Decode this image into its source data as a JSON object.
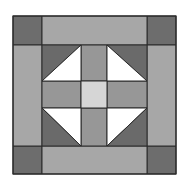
{
  "colors": {
    "background": "#ffffff",
    "line": "#2a2a2a",
    "corner_dark": "#6d6d6d",
    "border_strip": "#a7a7a7",
    "cross_arm": "#979797",
    "center_light": "#d6d6d6",
    "triangle_dark": "#6a6a6a",
    "triangle_light": "#ffffff"
  },
  "grid": {
    "cols": [
      13,
      42,
      81,
      107,
      147,
      176
    ],
    "rows": [
      16,
      45,
      81,
      108,
      146,
      174
    ]
  },
  "patches": [
    {
      "name": "corner-top-left",
      "fill": "corner_dark",
      "points": "13,16 42,16 42,45 13,45"
    },
    {
      "name": "corner-top-right",
      "fill": "corner_dark",
      "points": "147,16 176,16 176,45 147,45"
    },
    {
      "name": "corner-bottom-left",
      "fill": "corner_dark",
      "points": "13,146 42,146 42,174 13,174"
    },
    {
      "name": "corner-bottom-right",
      "fill": "corner_dark",
      "points": "147,146 176,146 176,174 147,174"
    },
    {
      "name": "border-top",
      "fill": "border_strip",
      "points": "42,16 147,16 147,45 42,45"
    },
    {
      "name": "border-bottom",
      "fill": "border_strip",
      "points": "42,146 147,146 147,174 42,174"
    },
    {
      "name": "border-left",
      "fill": "border_strip",
      "points": "13,45 42,45 42,146 13,146"
    },
    {
      "name": "border-right",
      "fill": "border_strip",
      "points": "147,45 176,45 176,146 147,146"
    },
    {
      "name": "cross-top",
      "fill": "cross_arm",
      "points": "81,45 107,45 107,81 81,81"
    },
    {
      "name": "cross-bottom",
      "fill": "cross_arm",
      "points": "81,108 107,108 107,146 81,146"
    },
    {
      "name": "cross-left",
      "fill": "cross_arm",
      "points": "42,81 81,81 81,108 42,108"
    },
    {
      "name": "cross-right",
      "fill": "cross_arm",
      "points": "107,81 147,81 147,108 107,108"
    },
    {
      "name": "center-square",
      "fill": "center_light",
      "points": "81,81 107,81 107,108 81,108"
    },
    {
      "name": "hst-top-left-dark",
      "fill": "triangle_dark",
      "points": "42,45 81,45 42,81"
    },
    {
      "name": "hst-top-left-light",
      "fill": "triangle_light",
      "points": "81,45 81,81 42,81"
    },
    {
      "name": "hst-top-right-dark",
      "fill": "triangle_dark",
      "points": "107,45 147,45 147,81"
    },
    {
      "name": "hst-top-right-light",
      "fill": "triangle_light",
      "points": "107,45 147,81 107,81"
    },
    {
      "name": "hst-bottom-left-light",
      "fill": "triangle_light",
      "points": "42,108 81,108 81,146"
    },
    {
      "name": "hst-bottom-left-dark",
      "fill": "triangle_dark",
      "points": "42,108 81,146 42,146"
    },
    {
      "name": "hst-bottom-right-light",
      "fill": "triangle_light",
      "points": "107,108 147,108 107,146"
    },
    {
      "name": "hst-bottom-right-dark",
      "fill": "triangle_dark",
      "points": "147,108 147,146 107,146"
    }
  ]
}
